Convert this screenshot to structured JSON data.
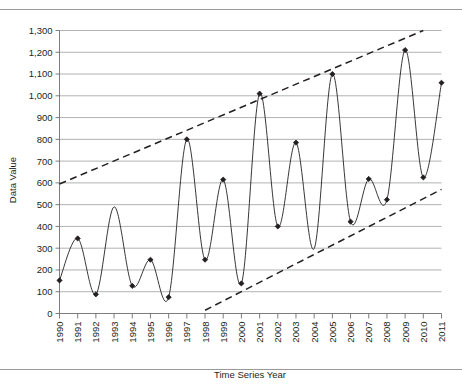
{
  "chart_data": {
    "type": "line",
    "title": "",
    "subtitle": "",
    "xlabel": "Time Series Year",
    "ylabel": "Data Value",
    "categories": [
      "1990",
      "1991",
      "1992",
      "1993",
      "1994",
      "1995",
      "1996",
      "1997",
      "1998",
      "1999",
      "2000",
      "2001",
      "2002",
      "2003",
      "2004",
      "2005",
      "2006",
      "2007",
      "2008",
      "2009",
      "2010",
      "2011"
    ],
    "values": [
      152,
      345,
      88,
      490,
      127,
      247,
      75,
      800,
      247,
      615,
      138,
      1010,
      400,
      785,
      298,
      1100,
      422,
      618,
      523,
      1210,
      625,
      1060
    ],
    "marked_points": [
      true,
      true,
      true,
      false,
      true,
      true,
      true,
      true,
      true,
      true,
      true,
      true,
      true,
      true,
      false,
      true,
      true,
      true,
      true,
      true,
      true,
      true
    ],
    "ylim": [
      0,
      1300
    ],
    "ytick_step": 100,
    "yticks": [
      "0",
      "100",
      "200",
      "300",
      "400",
      "500",
      "600",
      "700",
      "800",
      "900",
      "1,000",
      "1,100",
      "1,200",
      "1,300"
    ],
    "grid": "horizontal",
    "legend": "none",
    "smoothing": "spline",
    "marker": "diamond",
    "series": [
      {
        "name": "Data Value",
        "values": [
          152,
          345,
          88,
          490,
          127,
          247,
          75,
          800,
          247,
          615,
          138,
          1010,
          400,
          785,
          298,
          1100,
          422,
          618,
          523,
          1210,
          625,
          1060
        ]
      }
    ],
    "annotations": [
      {
        "name": "upper-trend-line",
        "style": "dashed",
        "x_start": "1990",
        "y_start": 595,
        "x_end": "2010",
        "y_end": 1300
      },
      {
        "name": "lower-trend-line",
        "style": "dashed",
        "x_start": "1998",
        "y_start": 15,
        "x_end": "2011",
        "y_end": 570
      }
    ],
    "colors": {
      "line": "#231f20",
      "marker": "#231f20",
      "grid": "#a7a9ac",
      "axis": "#6d6e71",
      "trend": "#231f20",
      "rule": "#9a9a9a"
    }
  }
}
